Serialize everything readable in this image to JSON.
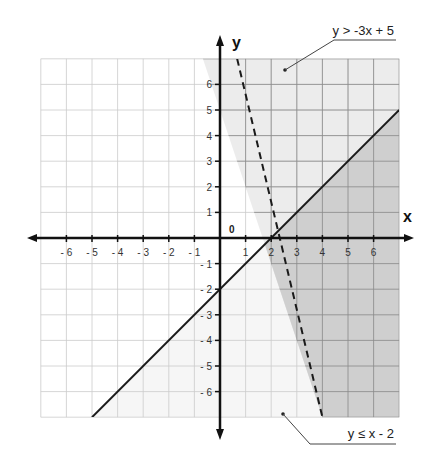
{
  "chart_data": {
    "type": "line",
    "title": "",
    "xlabel": "x",
    "ylabel": "y",
    "origin_label": "0",
    "xlim": [
      -7,
      7
    ],
    "ylim": [
      -7,
      7
    ],
    "grid": true,
    "x_ticks": [
      -6,
      -5,
      -4,
      -3,
      -2,
      -1,
      1,
      2,
      3,
      4,
      5,
      6
    ],
    "y_ticks": [
      -6,
      -5,
      -4,
      -3,
      -2,
      -1,
      1,
      2,
      3,
      4,
      5,
      6
    ],
    "x_tick_labels": [
      "- 6",
      "- 5",
      "- 4",
      "- 3",
      "- 2",
      "- 1",
      "1",
      "2",
      "3",
      "4",
      "5",
      "6"
    ],
    "y_tick_labels": [
      "- 6",
      "- 5",
      "- 4",
      "- 3",
      "- 2",
      "- 1",
      "1",
      "2",
      "3",
      "4",
      "5",
      "6"
    ],
    "series": [
      {
        "name": "y > -3x + 5",
        "equation": "y = -3x + 5",
        "inequality": ">",
        "style": "dashed",
        "slope": -3,
        "intercept": 5,
        "x": [
          0.67,
          4
        ],
        "y": [
          7,
          -7
        ],
        "shading": "above"
      },
      {
        "name": "y ≤ x - 2",
        "equation": "y = x - 2",
        "inequality": "≤",
        "style": "solid",
        "slope": 1,
        "intercept": -2,
        "x": [
          -5,
          7
        ],
        "y": [
          -7,
          5
        ],
        "shading": "below"
      }
    ],
    "intersection": {
      "x": 1.75,
      "y": -0.25
    },
    "annotations": [
      {
        "text": "y > -3x + 5",
        "points_to": [
          2.5,
          6.5
        ],
        "position": "top-right"
      },
      {
        "text": "y ≤ x - 2",
        "points_to": [
          2.5,
          -6.5
        ],
        "position": "bottom-right"
      }
    ],
    "colors": {
      "region_above_dashed": "#ececec",
      "region_overlap": "#cfcfcf",
      "region_below_solid": "#f6f6f6",
      "grid_light": "#cccccc",
      "grid_dark": "#8a8a8a",
      "axis": "#111111",
      "line": "#1a1a1a"
    }
  }
}
